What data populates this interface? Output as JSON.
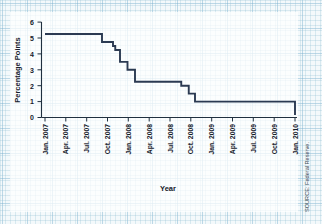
{
  "source_note": "SOURCE: Federal Reserve.",
  "chart_data": {
    "type": "line",
    "title": "",
    "xlabel": "Year",
    "ylabel": "Percentage Points",
    "grid": true,
    "legend": "none",
    "line_style": "step-after",
    "line_color": "#2b3a52",
    "ylim": [
      0,
      6
    ],
    "yticks": [
      0,
      1,
      2,
      3,
      4,
      5,
      6
    ],
    "ytick_labels": [
      "0",
      "1",
      "2",
      "3",
      "4",
      "5",
      "6"
    ],
    "xlim": [
      "Jan. 2007",
      "Apr. 2010"
    ],
    "xticks": [
      "Jan. 2007",
      "Apr. 2007",
      "Jul. 2007",
      "Oct. 2007",
      "Jan. 2008",
      "Apr. 2008",
      "Jul. 2008",
      "Oct. 2008",
      "Jan. 2009",
      "Apr. 2009",
      "Jul. 2009",
      "Oct. 2009",
      "Jan. 2010"
    ],
    "x": [
      "Jan. 2007",
      "Sep. 2007",
      "Oct. 2007",
      "Dec. 2007",
      "Jan. 2008a",
      "Jan. 2008b",
      "Mar. 2008",
      "Apr. 2008",
      "Oct. 2008a",
      "Oct. 2008b",
      "Dec. 2008",
      "Jan. 2010"
    ],
    "values": [
      5.25,
      5.25,
      4.75,
      4.5,
      4.25,
      3.5,
      3.0,
      2.25,
      2.0,
      1.5,
      1.0,
      0.15
    ],
    "series": [
      {
        "name": "Federal funds target rate",
        "values": [
          5.25,
          5.25,
          4.75,
          4.5,
          4.25,
          3.5,
          3.0,
          2.25,
          2.0,
          1.5,
          1.0,
          0.15
        ]
      }
    ]
  }
}
